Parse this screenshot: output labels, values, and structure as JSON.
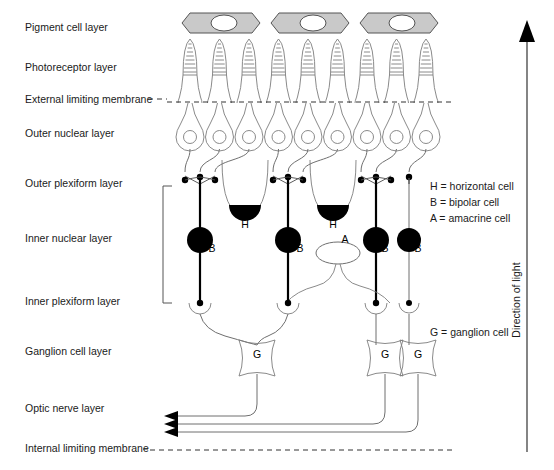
{
  "figure": {
    "background": "#ffffff",
    "ink": "#1a1a1a"
  },
  "layer_labels": [
    {
      "id": "pigment-cell-layer",
      "text": "Pigment cell layer",
      "y": 31
    },
    {
      "id": "photoreceptor-layer",
      "text": "Photoreceptor layer",
      "y": 71
    },
    {
      "id": "external-limiting-membrane",
      "text": "External limiting membrane",
      "y": 103
    },
    {
      "id": "outer-nuclear-layer",
      "text": "Outer nuclear layer",
      "y": 137
    },
    {
      "id": "outer-plexiform-layer",
      "text": "Outer plexiform layer",
      "y": 187
    },
    {
      "id": "inner-nuclear-layer",
      "text": "Inner nuclear layer",
      "y": 242
    },
    {
      "id": "inner-plexiform-layer",
      "text": "Inner plexiform layer",
      "y": 305
    },
    {
      "id": "ganglion-cell-layer",
      "text": "Ganglion cell layer",
      "y": 355
    },
    {
      "id": "optic-nerve-layer",
      "text": "Optic nerve layer",
      "y": 412
    },
    {
      "id": "internal-limiting-membrane",
      "text": "Internal limiting membrane",
      "y": 452
    }
  ],
  "legend": {
    "upper": [
      {
        "key": "H",
        "text": "H = horizontal cell",
        "y": 190
      },
      {
        "key": "B",
        "text": "B = bipolar cell",
        "y": 206
      },
      {
        "key": "A",
        "text": "A = amacrine cell",
        "y": 222
      }
    ],
    "lower": [
      {
        "key": "G",
        "text": "G = ganglion cell",
        "y": 336
      }
    ]
  },
  "direction_arrow": {
    "label": "Direction of light",
    "orientation": "upward",
    "x": 527,
    "tip_y": 22,
    "tail_y": 452,
    "text_x": 520,
    "text_y": 300
  },
  "cell_markers": {
    "bipolar": [
      {
        "label": "B",
        "x": 212,
        "y": 252
      },
      {
        "label": "B",
        "x": 300,
        "y": 252
      },
      {
        "label": "B",
        "x": 385,
        "y": 252
      },
      {
        "label": "B",
        "x": 418,
        "y": 252
      }
    ],
    "horizontal": [
      {
        "label": "H",
        "x": 245,
        "y": 228
      },
      {
        "label": "H",
        "x": 333,
        "y": 228
      }
    ],
    "amacrine": [
      {
        "label": "A",
        "x": 345,
        "y": 243
      }
    ],
    "ganglion": [
      {
        "label": "G",
        "x": 257,
        "y": 358
      },
      {
        "label": "G",
        "x": 385,
        "y": 358
      },
      {
        "label": "G",
        "x": 418,
        "y": 358
      }
    ]
  },
  "membranes": {
    "external_limiting": {
      "y": 102,
      "x_start": 167,
      "x_end": 452,
      "style": "dashed"
    },
    "internal_limiting": {
      "y": 450,
      "x_start": 150,
      "x_end": 452,
      "style": "dashed"
    }
  },
  "counts": {
    "pigment_cells": 3,
    "photoreceptors": 9,
    "bipolar_cells": 4,
    "horizontal_cells": 2,
    "amacrine_cells": 1,
    "ganglion_cells": 3,
    "optic_nerve_axons": 3
  },
  "colors": {
    "pigment_fill": "#c9c9c9",
    "cell_outline": "#7d7d7d",
    "nucleus_black": "#000000",
    "nucleus_white": "#ffffff"
  }
}
